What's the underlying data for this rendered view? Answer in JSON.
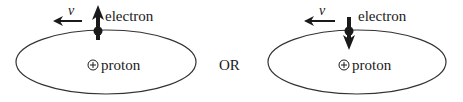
{
  "diagrams": [
    {
      "id": "left",
      "velocity_label": "v",
      "electron_label": "electron",
      "proton_label": "proton",
      "proton_symbol": "+",
      "spin_direction": "up"
    },
    {
      "id": "right",
      "velocity_label": "v",
      "electron_label": "electron",
      "proton_label": "proton",
      "proton_symbol": "+",
      "spin_direction": "down"
    }
  ],
  "separator_label": "OR",
  "colors": {
    "ink": "#1a1a1a",
    "orbit": "#333333",
    "background": "#ffffff"
  }
}
